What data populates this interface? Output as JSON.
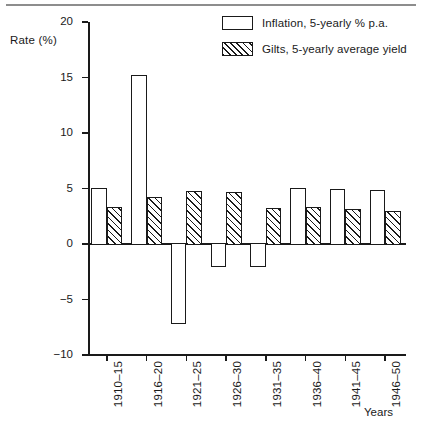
{
  "figure": {
    "y_axis_title": "Rate (%)",
    "x_axis_title": "Years"
  },
  "legend": {
    "items": [
      {
        "label": "Inflation, 5-yearly % p.a.",
        "swatch": "open-rectangle"
      },
      {
        "label": "Gilts, 5-yearly average yield",
        "swatch": "hatched-rectangle"
      }
    ]
  },
  "chart_data": {
    "type": "bar",
    "title": "",
    "xlabel": "Years",
    "ylabel": "Rate (%)",
    "ylim": [
      -10,
      20
    ],
    "yticks": [
      20,
      15,
      10,
      5,
      0,
      -5,
      -10
    ],
    "ytick_labels": [
      "20",
      "15",
      "10",
      "5",
      "0",
      "−5",
      "−10"
    ],
    "grid": false,
    "legend_position": "top-right",
    "categories": [
      "1910–15",
      "1916–20",
      "1921–25",
      "1926–30",
      "1931–35",
      "1936–40",
      "1941–45",
      "1946–50"
    ],
    "series": [
      {
        "name": "Inflation, 5-yearly % p.a.",
        "values": [
          5.0,
          15.2,
          -7.1,
          -2.0,
          -2.0,
          5.0,
          4.9,
          4.8
        ]
      },
      {
        "name": "Gilts, 5-yearly average yield",
        "values": [
          3.3,
          4.2,
          4.7,
          4.6,
          3.2,
          3.3,
          3.1,
          2.9
        ]
      }
    ]
  }
}
